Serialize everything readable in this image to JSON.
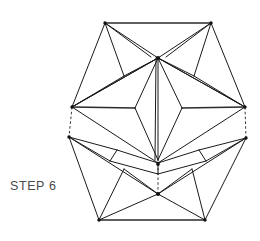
{
  "page": {
    "background_color": "#ffffff"
  },
  "caption": {
    "label": "STEP 6",
    "color": "#4a4a4a"
  },
  "diagram": {
    "name": "hexagonal-folded-model",
    "line_color": "#1a1a1a",
    "dashed_line_color": "#3a3a3a",
    "view_box": "0 0 260 241",
    "vertices": {
      "top_left": [
        105,
        23
      ],
      "top_right": [
        211,
        23
      ],
      "left_upper": [
        72,
        107
      ],
      "right_upper": [
        245,
        107
      ],
      "left_lower": [
        69,
        137
      ],
      "right_lower": [
        246,
        138
      ],
      "bottom_left": [
        99,
        220
      ],
      "bottom_right": [
        205,
        220
      ],
      "hub_top": [
        158,
        58
      ],
      "hub_mid": [
        158,
        163
      ],
      "hub_bottom": [
        158,
        194
      ],
      "kite_left": [
        135,
        108
      ],
      "kite_right": [
        182,
        108
      ],
      "kite_bottom": [
        158,
        160
      ],
      "crease_left": [
        117,
        149
      ],
      "crease_right": [
        199,
        149
      ],
      "fold_left": [
        108,
        160
      ],
      "fold_right": [
        208,
        160
      ]
    },
    "edges_solid": [
      [
        105,
        23,
        211,
        23
      ],
      [
        105,
        23,
        72,
        107
      ],
      [
        211,
        23,
        245,
        107
      ],
      [
        69,
        137,
        99,
        220
      ],
      [
        246,
        138,
        205,
        220
      ],
      [
        99,
        220,
        205,
        220
      ],
      [
        105,
        23,
        158,
        58
      ],
      [
        211,
        23,
        158,
        58
      ],
      [
        105,
        23,
        143,
        55
      ],
      [
        211,
        23,
        175,
        55
      ],
      [
        72,
        107,
        158,
        58
      ],
      [
        245,
        107,
        158,
        58
      ],
      [
        72,
        107,
        135,
        108
      ],
      [
        245,
        107,
        182,
        108
      ],
      [
        135,
        108,
        158,
        58
      ],
      [
        182,
        108,
        158,
        58
      ],
      [
        135,
        108,
        158,
        160
      ],
      [
        182,
        108,
        158,
        160
      ],
      [
        158,
        58,
        158,
        160
      ],
      [
        72,
        107,
        245,
        107
      ],
      [
        72,
        107,
        69,
        137
      ],
      [
        245,
        107,
        246,
        138
      ],
      [
        69,
        137,
        117,
        149
      ],
      [
        246,
        138,
        199,
        149
      ],
      [
        117,
        149,
        158,
        163
      ],
      [
        199,
        149,
        158,
        163
      ],
      [
        69,
        137,
        108,
        160
      ],
      [
        246,
        138,
        208,
        160
      ],
      [
        108,
        160,
        158,
        172
      ],
      [
        208,
        160,
        158,
        172
      ],
      [
        117,
        149,
        108,
        160
      ],
      [
        199,
        149,
        208,
        160
      ],
      [
        158,
        163,
        158,
        172
      ],
      [
        72,
        107,
        158,
        163
      ],
      [
        245,
        107,
        158,
        163
      ],
      [
        69,
        137,
        158,
        194
      ],
      [
        246,
        138,
        158,
        194
      ],
      [
        99,
        220,
        158,
        194
      ],
      [
        205,
        220,
        158,
        194
      ],
      [
        99,
        220,
        130,
        168
      ],
      [
        205,
        220,
        186,
        168
      ],
      [
        130,
        168,
        158,
        194
      ],
      [
        186,
        168,
        158,
        194
      ],
      [
        69,
        137,
        99,
        220
      ],
      [
        246,
        138,
        205,
        220
      ]
    ],
    "edges_dashed": [
      [
        72,
        107,
        69,
        137
      ],
      [
        245,
        107,
        246,
        138
      ],
      [
        158,
        163,
        158,
        194
      ]
    ],
    "vertex_dots": [
      [
        105,
        23
      ],
      [
        211,
        23
      ],
      [
        72,
        107
      ],
      [
        245,
        107
      ],
      [
        69,
        137
      ],
      [
        246,
        138
      ],
      [
        99,
        220
      ],
      [
        205,
        220
      ],
      [
        158,
        58
      ],
      [
        158,
        163
      ],
      [
        158,
        194
      ]
    ]
  }
}
